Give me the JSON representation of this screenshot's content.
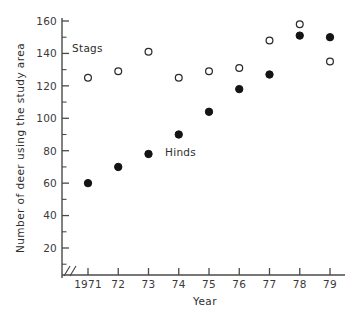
{
  "chart_data": {
    "type": "scatter",
    "title": "",
    "xlabel": "Year",
    "ylabel": "Number of deer using the study area",
    "x": [
      1971,
      1972,
      1973,
      1974,
      1975,
      1976,
      1977,
      1978,
      1979
    ],
    "categories": [
      "1971",
      "72",
      "73",
      "74",
      "75",
      "76",
      "77",
      "78",
      "79"
    ],
    "series": [
      {
        "name": "Stags",
        "marker": "open-circle",
        "values": [
          125,
          129,
          141,
          125,
          129,
          131,
          148,
          158,
          135
        ]
      },
      {
        "name": "Hinds",
        "marker": "filled-circle",
        "values": [
          60,
          70,
          78,
          90,
          104,
          118,
          127,
          151,
          150
        ]
      }
    ],
    "ylim": [
      0,
      165
    ],
    "xlim": [
      1970.5,
      1979.5
    ],
    "y_ticks_major": [
      20,
      40,
      60,
      80,
      100,
      120,
      140,
      160
    ],
    "y_tick_labels": [
      "20",
      "40",
      "60",
      "80",
      "100",
      "120",
      "140",
      "160"
    ],
    "y_ticks_minor": [
      10,
      30,
      50,
      70,
      90,
      110,
      130,
      150
    ],
    "y_axis_break": true,
    "grid": false,
    "legend_position": "inline-annotations",
    "annotations": [
      {
        "text": "Stags",
        "x": 1971.0,
        "y": 140
      },
      {
        "text": "Hinds",
        "x": 1974.7,
        "y": 79
      }
    ]
  },
  "colors": {
    "axis": "#4a4a4a",
    "text": "#2e2e2e",
    "stags_marker_stroke": "#2b2b2b",
    "stags_marker_fill": "#ffffff",
    "hinds_marker_fill": "#141414",
    "background": "#ffffff"
  },
  "axis_labels": {
    "x_title": "Year",
    "y_title": "Number of deer using the study area"
  }
}
